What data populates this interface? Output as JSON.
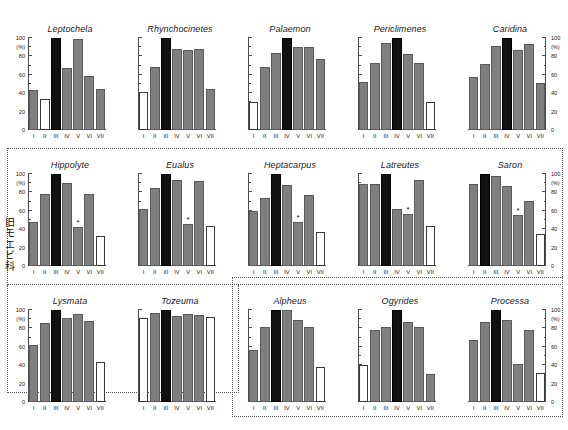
{
  "figure": {
    "axis": {
      "y_unit": "(%)",
      "y_ticks": [
        "0",
        "20",
        "40",
        "60",
        "80",
        "100"
      ],
      "ylim": [
        0,
        100
      ],
      "x_categories": [
        "I",
        "II",
        "III",
        "IV",
        "V",
        "VI",
        "VII"
      ],
      "star_symbol": "*"
    },
    "group_label_vertical": [
      "旧",
      "モ",
      "エ",
      "ビ",
      "科"
    ],
    "groups": [
      {
        "name": "hippolytidae-group"
      },
      {
        "name": "lower-right-group"
      }
    ]
  },
  "chart_data": [
    {
      "type": "bar",
      "title": "Leptochela",
      "categories": [
        "I",
        "II",
        "III",
        "IV",
        "V",
        "VI",
        "VII"
      ],
      "values": [
        44,
        34,
        100,
        67,
        99,
        59,
        45
      ],
      "colors": [
        "gray",
        "white",
        "black",
        "gray",
        "gray",
        "gray",
        "gray"
      ],
      "stars": [],
      "ylabel": "(%)",
      "ylim": [
        0,
        100
      ],
      "y_axis_side": "left"
    },
    {
      "type": "bar",
      "title": "Rhynchocinetes",
      "categories": [
        "I",
        "II",
        "III",
        "IV",
        "V",
        "VI",
        "VII"
      ],
      "values": [
        41,
        68,
        100,
        88,
        87,
        88,
        45
      ],
      "colors": [
        "white",
        "gray",
        "black",
        "gray",
        "gray",
        "gray",
        "gray"
      ],
      "stars": [],
      "ylabel": "",
      "ylim": [
        0,
        100
      ],
      "y_axis_side": "none"
    },
    {
      "type": "bar",
      "title": "Palaemon",
      "categories": [
        "I",
        "II",
        "III",
        "IV",
        "V",
        "VI",
        "VII"
      ],
      "values": [
        30,
        69,
        84,
        100,
        90,
        90,
        77
      ],
      "colors": [
        "white",
        "gray",
        "gray",
        "black",
        "gray",
        "gray",
        "gray"
      ],
      "stars": [],
      "ylabel": "",
      "ylim": [
        0,
        100
      ],
      "y_axis_side": "none"
    },
    {
      "type": "bar",
      "title": "Periclimenes",
      "categories": [
        "I",
        "II",
        "III",
        "IV",
        "V",
        "VI",
        "VII"
      ],
      "values": [
        52,
        73,
        95,
        100,
        83,
        73,
        30
      ],
      "colors": [
        "gray",
        "gray",
        "gray",
        "black",
        "gray",
        "gray",
        "white"
      ],
      "stars": [],
      "ylabel": "",
      "ylim": [
        0,
        100
      ],
      "y_axis_side": "none"
    },
    {
      "type": "bar",
      "title": "Caridina",
      "categories": [
        "I",
        "II",
        "III",
        "IV",
        "V",
        "VI",
        "VII"
      ],
      "values": [
        58,
        72,
        91,
        100,
        87,
        94,
        51
      ],
      "colors": [
        "gray",
        "gray",
        "gray",
        "black",
        "gray",
        "gray",
        "gray"
      ],
      "stars": [],
      "ylabel": "(%)",
      "ylim": [
        0,
        100
      ],
      "y_axis_side": "right"
    },
    {
      "type": "bar",
      "title": "Hippolyte",
      "categories": [
        "I",
        "II",
        "III",
        "IV",
        "V",
        "VI",
        "VII"
      ],
      "values": [
        48,
        78,
        100,
        90,
        42,
        78,
        33
      ],
      "colors": [
        "gray",
        "gray",
        "black",
        "gray",
        "gray",
        "gray",
        "white"
      ],
      "stars": [
        "V"
      ],
      "ylabel": "(%)",
      "ylim": [
        0,
        100
      ],
      "y_axis_side": "left"
    },
    {
      "type": "bar",
      "title": "Eualus",
      "categories": [
        "I",
        "II",
        "III",
        "IV",
        "V",
        "VI",
        "VII"
      ],
      "values": [
        62,
        85,
        100,
        94,
        46,
        92,
        44
      ],
      "colors": [
        "gray",
        "gray",
        "black",
        "gray",
        "gray",
        "gray",
        "white"
      ],
      "stars": [
        "V"
      ],
      "ylabel": "",
      "ylim": [
        0,
        100
      ],
      "y_axis_side": "none"
    },
    {
      "type": "bar",
      "title": "Heptacarpus",
      "categories": [
        "I",
        "II",
        "III",
        "IV",
        "V",
        "VI",
        "VII"
      ],
      "values": [
        60,
        74,
        100,
        88,
        48,
        77,
        37
      ],
      "colors": [
        "gray",
        "gray",
        "black",
        "gray",
        "gray",
        "gray",
        "white"
      ],
      "stars": [
        "V"
      ],
      "ylabel": "",
      "ylim": [
        0,
        100
      ],
      "y_axis_side": "none"
    },
    {
      "type": "bar",
      "title": "Latreutes",
      "categories": [
        "I",
        "II",
        "III",
        "IV",
        "V",
        "VI",
        "VII"
      ],
      "values": [
        89,
        89,
        100,
        62,
        56,
        93,
        44
      ],
      "colors": [
        "gray",
        "gray",
        "black",
        "gray",
        "gray",
        "gray",
        "white"
      ],
      "stars": [
        "V"
      ],
      "ylabel": "",
      "ylim": [
        0,
        100
      ],
      "y_axis_side": "none"
    },
    {
      "type": "bar",
      "title": "Saron",
      "categories": [
        "I",
        "II",
        "III",
        "IV",
        "V",
        "VI",
        "VII"
      ],
      "values": [
        89,
        100,
        98,
        87,
        55,
        71,
        35
      ],
      "colors": [
        "gray",
        "black",
        "gray",
        "gray",
        "gray",
        "gray",
        "white"
      ],
      "stars": [
        "V"
      ],
      "ylabel": "(%)",
      "ylim": [
        0,
        100
      ],
      "y_axis_side": "right"
    },
    {
      "type": "bar",
      "title": "Lysmata",
      "categories": [
        "I",
        "II",
        "III",
        "IV",
        "V",
        "VI",
        "VII"
      ],
      "values": [
        62,
        86,
        100,
        91,
        96,
        88,
        44
      ],
      "colors": [
        "gray",
        "gray",
        "black",
        "gray",
        "gray",
        "gray",
        "white"
      ],
      "stars": [],
      "ylabel": "(%)",
      "ylim": [
        0,
        100
      ],
      "y_axis_side": "left"
    },
    {
      "type": "bar",
      "title": "Tozeuma",
      "categories": [
        "I",
        "II",
        "III",
        "IV",
        "V",
        "VI",
        "VII"
      ],
      "values": [
        91,
        97,
        100,
        93,
        96,
        95,
        92
      ],
      "colors": [
        "white",
        "gray",
        "black",
        "gray",
        "gray",
        "gray",
        "white"
      ],
      "stars": [],
      "ylabel": "",
      "ylim": [
        0,
        100
      ],
      "y_axis_side": "none"
    },
    {
      "type": "bar",
      "title": "Alpheus",
      "categories": [
        "I",
        "II",
        "III",
        "IV",
        "V",
        "VI",
        "VII"
      ],
      "values": [
        56,
        82,
        100,
        100,
        89,
        82,
        38
      ],
      "colors": [
        "gray",
        "gray",
        "black",
        "gray",
        "gray",
        "gray",
        "white"
      ],
      "stars": [],
      "ylabel": "",
      "ylim": [
        0,
        100
      ],
      "y_axis_side": "none"
    },
    {
      "type": "bar",
      "title": "Ogyrides",
      "categories": [
        "I",
        "II",
        "III",
        "IV",
        "V",
        "VI",
        "VII"
      ],
      "values": [
        40,
        78,
        82,
        100,
        87,
        82,
        30
      ],
      "colors": [
        "white",
        "gray",
        "gray",
        "black",
        "gray",
        "gray",
        "gray"
      ],
      "stars": [],
      "ylabel": "",
      "ylim": [
        0,
        100
      ],
      "y_axis_side": "none"
    },
    {
      "type": "bar",
      "title": "Processa",
      "categories": [
        "I",
        "II",
        "III",
        "IV",
        "V",
        "VI",
        "VII"
      ],
      "values": [
        67,
        87,
        100,
        89,
        41,
        78,
        31
      ],
      "colors": [
        "gray",
        "gray",
        "black",
        "gray",
        "gray",
        "gray",
        "white"
      ],
      "stars": [],
      "ylabel": "(%)",
      "ylim": [
        0,
        100
      ],
      "y_axis_side": "right"
    }
  ]
}
